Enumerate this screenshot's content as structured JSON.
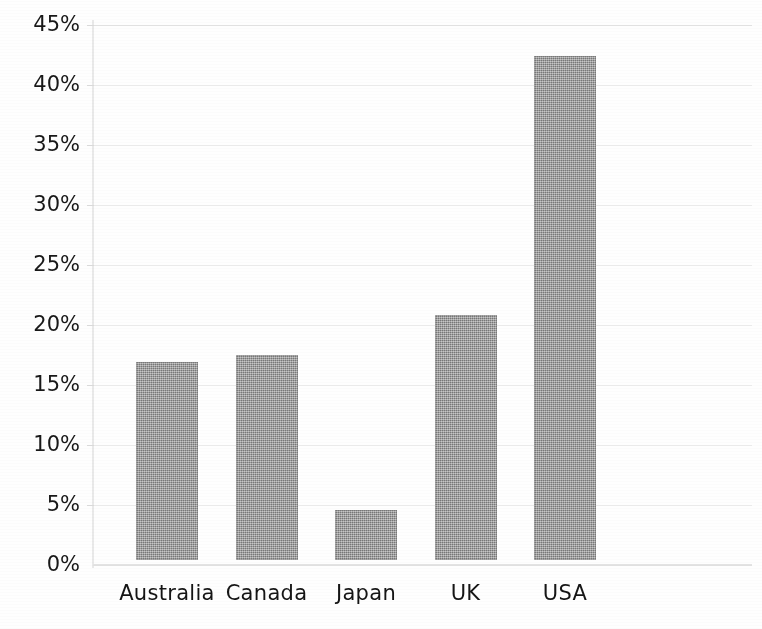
{
  "chart_data": {
    "type": "bar",
    "title": "",
    "subtitle": "",
    "xlabel": "",
    "ylabel": "",
    "categories": [
      "Australia",
      "Canada",
      "Japan",
      "UK",
      "USA"
    ],
    "values": [
      16.9,
      17.5,
      4.6,
      20.8,
      42.4
    ],
    "value_labels": [
      "16.9%",
      "17.5%",
      "4.6%",
      "20.8%",
      "42.4%"
    ],
    "ylim": [
      0,
      45
    ],
    "ytick_values": [
      0,
      5,
      10,
      15,
      20,
      25,
      30,
      35,
      40,
      45
    ],
    "ytick_labels": [
      "0%",
      "5%",
      "10%",
      "15%",
      "20%",
      "25%",
      "30%",
      "35%",
      "40%",
      "45%"
    ],
    "grid": true,
    "grid_axis": "y",
    "legend": null,
    "legend_position": "none",
    "annotations": [],
    "series": [
      {
        "name": "Share",
        "values": [
          16.9,
          17.5,
          4.6,
          20.8,
          42.4
        ]
      }
    ],
    "colors": {
      "bar_fill": "#949494",
      "gridline": "#ededed",
      "axis": "#e3e3e3",
      "text": "#181818",
      "background": "#fefefe"
    }
  },
  "axis": {
    "y_labels": [
      "45%",
      "40%",
      "35%",
      "30%",
      "25%",
      "20%",
      "15%",
      "10%",
      "5%",
      "0%"
    ],
    "x_labels": [
      "Australia",
      "Canada",
      "Japan",
      "UK",
      "USA"
    ]
  }
}
